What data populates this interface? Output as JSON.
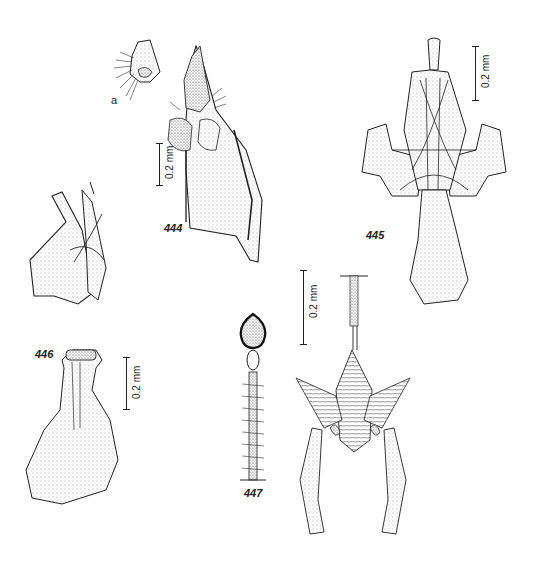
{
  "plate": {
    "figures": [
      {
        "id": "444",
        "label": "444",
        "sublabel": "a",
        "scale": "0.2 mm"
      },
      {
        "id": "445",
        "label": "445",
        "scale": "0.2 mm"
      },
      {
        "id": "446",
        "label": "446",
        "scale": "0.2 mm"
      },
      {
        "id": "447",
        "label": "447",
        "scale": "0.2 mm"
      }
    ]
  }
}
